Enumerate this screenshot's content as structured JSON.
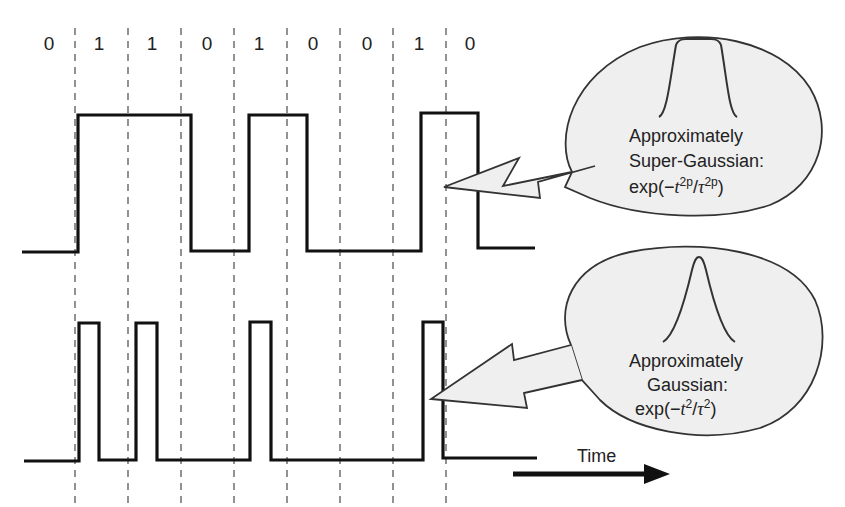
{
  "diagram": {
    "bit_sequence": [
      "0",
      "1",
      "1",
      "0",
      "1",
      "0",
      "0",
      "1",
      "0"
    ],
    "waveforms": [
      {
        "name": "NRZ",
        "description": "Non-return-to-zero waveform, pulses fill full bit slot"
      },
      {
        "name": "RZ",
        "description": "Return-to-zero waveform, short pulses at start of each 1 bit"
      }
    ],
    "callouts": {
      "top": {
        "line1": "Approximately",
        "line2": "Super-Gaussian:",
        "formula_prefix": "exp(−",
        "formula_t": "t",
        "formula_t_exp": "2p",
        "formula_slash": "/",
        "formula_tau": "τ",
        "formula_tau_exp": "2p",
        "formula_suffix": ")"
      },
      "bottom": {
        "line1": "Approximately",
        "line2": "Gaussian:",
        "formula_prefix": "exp(−",
        "formula_t": "t",
        "formula_t_exp": "2",
        "formula_slash": "/",
        "formula_tau": "τ",
        "formula_tau_exp": "2",
        "formula_suffix": ")"
      }
    },
    "time_axis": {
      "label": "Time"
    },
    "colors": {
      "line": "#111111",
      "dash": "#777777",
      "bubble_fill": "#efefef",
      "bubble_stroke": "#333333"
    }
  }
}
